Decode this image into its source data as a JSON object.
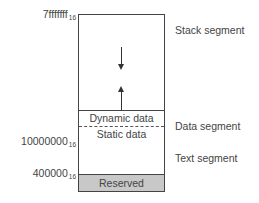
{
  "addresses": {
    "top": {
      "value": "7fffffff",
      "base": "16"
    },
    "text_start": {
      "value": "10000000",
      "base": "16"
    },
    "reserved_end": {
      "value": "400000",
      "base": "16"
    }
  },
  "segments": {
    "stack": "Stack segment",
    "data": "Data segment",
    "text": "Text segment"
  },
  "cells": {
    "dynamic": "Dynamic data",
    "static": "Static data",
    "reserved": "Reserved"
  },
  "colors": {
    "reserved_fill": "#c8c8c8",
    "line": "#444444"
  }
}
